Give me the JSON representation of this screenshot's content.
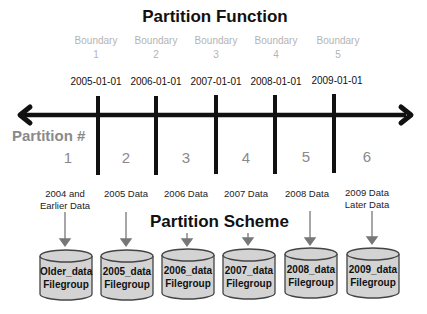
{
  "function": {
    "title": "Partition Function",
    "boundaries": [
      {
        "label": "Boundary",
        "number": "1",
        "value": "2005-01-01"
      },
      {
        "label": "Boundary",
        "number": "2",
        "value": "2006-01-01"
      },
      {
        "label": "Boundary",
        "number": "3",
        "value": "2007-01-01"
      },
      {
        "label": "Boundary",
        "number": "4",
        "value": "2008-01-01"
      },
      {
        "label": "Boundary",
        "number": "5",
        "value": "2009-01-01"
      }
    ]
  },
  "partitions": {
    "label": "Partition #",
    "numbers": [
      "1",
      "2",
      "3",
      "4",
      "5",
      "6"
    ],
    "data": [
      {
        "line1": "2004 and",
        "line2": "Earlier Data"
      },
      {
        "line1": "2005 Data",
        "line2": ""
      },
      {
        "line1": "2006 Data",
        "line2": ""
      },
      {
        "line1": "2007 Data",
        "line2": ""
      },
      {
        "line1": "2008 Data",
        "line2": ""
      },
      {
        "line1": "2009 Data",
        "line2": "Later Data"
      }
    ]
  },
  "scheme": {
    "title": "Partition Scheme",
    "filegroups": [
      {
        "name": "Older_data",
        "type": "Filegroup"
      },
      {
        "name": "2005_data",
        "type": "Filegroup"
      },
      {
        "name": "2006_data",
        "type": "Filegroup"
      },
      {
        "name": "2007_data",
        "type": "Filegroup"
      },
      {
        "name": "2008_data",
        "type": "Filegroup"
      },
      {
        "name": "2009_data",
        "type": "Filegroup"
      }
    ]
  },
  "colors": {
    "line": "#111111",
    "boundary_text": "#b4b4b4",
    "partition_text": "#8a8a8a",
    "cylinder_fill": "#d3d3d3",
    "cylinder_stroke": "#444444",
    "connector": "#777777"
  }
}
